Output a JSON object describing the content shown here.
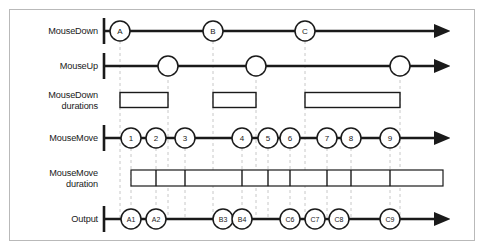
{
  "figure": {
    "frame": {
      "x": 9,
      "y": 9,
      "width": 466,
      "height": 232,
      "border_color": "#b9b9b9",
      "background": "#ffffff"
    },
    "ink_color": "#1a1a1a",
    "guide_color": "#c8c8c8"
  },
  "axis": {
    "start_x": 103,
    "end_x": 443,
    "tick_x": 104
  },
  "rows": [
    {
      "id": "mousedown",
      "label": "MouseDown",
      "label_x_right": 98,
      "y": 31,
      "type": "timeline",
      "nodes": [
        {
          "label": "A",
          "x": 120,
          "r": 10
        },
        {
          "label": "B",
          "x": 213,
          "r": 10
        },
        {
          "label": "C",
          "x": 305,
          "r": 10
        }
      ]
    },
    {
      "id": "mouseup",
      "label": "MouseUp",
      "label_x_right": 98,
      "y": 66,
      "type": "timeline",
      "nodes": [
        {
          "label": "",
          "x": 168,
          "r": 10
        },
        {
          "label": "",
          "x": 256,
          "r": 10
        },
        {
          "label": "",
          "x": 400,
          "r": 10
        }
      ]
    },
    {
      "id": "mousedown-durations",
      "label": "MouseDown\ndurations",
      "label_x_right": 98,
      "y": 100,
      "type": "bars",
      "bar_height": 15,
      "bars": [
        {
          "x1": 120,
          "x2": 168
        },
        {
          "x1": 213,
          "x2": 256
        },
        {
          "x1": 305,
          "x2": 400
        }
      ]
    },
    {
      "id": "mousemove",
      "label": "MouseMove",
      "label_x_right": 98,
      "y": 138,
      "type": "timeline",
      "nodes": [
        {
          "label": "1",
          "x": 131,
          "r": 10
        },
        {
          "label": "2",
          "x": 156,
          "r": 10
        },
        {
          "label": "3",
          "x": 185,
          "r": 10
        },
        {
          "label": "4",
          "x": 242,
          "r": 10
        },
        {
          "label": "5",
          "x": 268,
          "r": 10
        },
        {
          "label": "6",
          "x": 290,
          "r": 10
        },
        {
          "label": "7",
          "x": 327,
          "r": 10
        },
        {
          "label": "8",
          "x": 351,
          "r": 10
        },
        {
          "label": "9",
          "x": 390,
          "r": 10
        }
      ]
    },
    {
      "id": "mousemove-duration",
      "label": "MouseMove\nduration",
      "label_x_right": 98,
      "y": 178,
      "type": "grid",
      "grid_height": 16,
      "grid_x1": 131,
      "grid_x2": 443,
      "dividers": [
        156,
        185,
        242,
        268,
        290,
        327,
        351,
        390
      ]
    },
    {
      "id": "output",
      "label": "Output",
      "label_x_right": 98,
      "y": 219,
      "type": "timeline",
      "nodes": [
        {
          "label": "A1",
          "x": 131,
          "r": 10
        },
        {
          "label": "A2",
          "x": 156,
          "r": 10
        },
        {
          "label": "B3",
          "x": 223,
          "r": 10
        },
        {
          "label": "B4",
          "x": 242,
          "r": 10
        },
        {
          "label": "C6",
          "x": 290,
          "r": 10
        },
        {
          "label": "C7",
          "x": 315,
          "r": 10
        },
        {
          "label": "C8",
          "x": 339,
          "r": 10
        },
        {
          "label": "C9",
          "x": 390,
          "r": 10
        }
      ]
    }
  ],
  "guides": [
    {
      "x": 120,
      "y1": 41,
      "y2": 219
    },
    {
      "x": 168,
      "y1": 56,
      "y2": 219
    },
    {
      "x": 131,
      "y1": 148,
      "y2": 219
    },
    {
      "x": 156,
      "y1": 148,
      "y2": 219
    },
    {
      "x": 185,
      "y1": 148,
      "y2": 219
    },
    {
      "x": 213,
      "y1": 41,
      "y2": 219
    },
    {
      "x": 242,
      "y1": 148,
      "y2": 219
    },
    {
      "x": 256,
      "y1": 56,
      "y2": 219
    },
    {
      "x": 268,
      "y1": 148,
      "y2": 219
    },
    {
      "x": 290,
      "y1": 148,
      "y2": 219
    },
    {
      "x": 305,
      "y1": 41,
      "y2": 219
    },
    {
      "x": 327,
      "y1": 148,
      "y2": 219
    },
    {
      "x": 351,
      "y1": 148,
      "y2": 219
    },
    {
      "x": 390,
      "y1": 148,
      "y2": 219
    },
    {
      "x": 400,
      "y1": 56,
      "y2": 219
    }
  ]
}
